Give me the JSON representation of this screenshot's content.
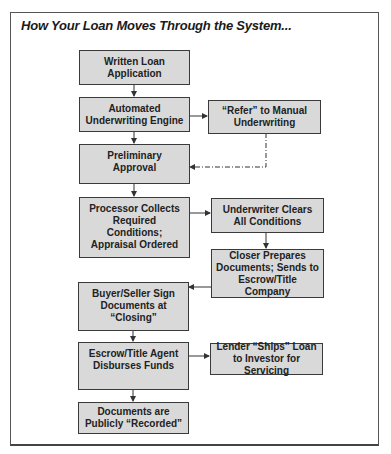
{
  "title": "How Your Loan Moves Through the System...",
  "nodes": {
    "written_application": "Written Loan Application",
    "automated_underwriting": "Automated Underwriting Engine",
    "refer_manual": "“Refer” to Manual Underwriting",
    "preliminary_approval": "Preliminary Approval",
    "processor_collects": "Processor Collects Required Conditions; Appraisal Ordered",
    "underwriter_clears": "Underwriter Clears All Conditions",
    "closer_prepares": "Closer Prepares Documents; Sends to Escrow/Title Company",
    "buyer_seller_sign": "Buyer/Seller Sign Documents at “Closing”",
    "escrow_disburses": "Escrow/Title Agent Disburses Funds",
    "lender_ships": "Lender “Ships” Loan to Investor for Servicing",
    "documents_recorded": "Documents are Publicly “Recorded”"
  },
  "colors": {
    "box_fill": "#d9d9d9",
    "box_border": "#3a3a3a",
    "arrow": "#333333"
  }
}
